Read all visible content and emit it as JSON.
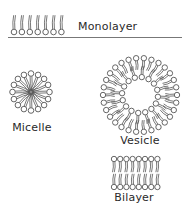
{
  "diagram": {
    "title": "",
    "colors": {
      "stroke": "#555555",
      "head_fill": "#ffffff",
      "text": "#2a2a2a"
    },
    "structures": [
      {
        "id": "monolayer",
        "label": "Monolayer",
        "lipid_count": 7,
        "surface_line": true
      },
      {
        "id": "micelle",
        "label": "Micelle",
        "lipid_count": 16
      },
      {
        "id": "vesicle",
        "label": "Vesicle",
        "outer_lipid_count": 30,
        "inner_lipid_count": 16
      },
      {
        "id": "bilayer",
        "label": "Bilayer",
        "lipid_pairs": 8
      }
    ]
  }
}
